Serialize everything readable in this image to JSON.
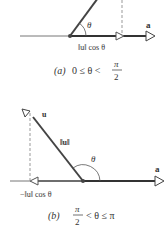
{
  "figure": {
    "panel_a": {
      "vector_u_label": "u",
      "vector_a_label": "a",
      "angle_label": "θ",
      "projection_label": "‖u‖ cos θ",
      "caption_prefix": "(a)",
      "caption_condition": "0 ≤ θ <",
      "caption_frac_num": "π",
      "caption_frac_den": "2"
    },
    "panel_b": {
      "vector_u_label": "u",
      "vector_a_label": "a",
      "angle_label": "θ",
      "norm_label": "‖u‖",
      "projection_label": "−‖u‖ cos θ",
      "caption_prefix": "(b)",
      "caption_frac_num": "π",
      "caption_frac_den": "2",
      "caption_condition": "< θ ≤ π"
    },
    "colors": {
      "vector": "#444444",
      "axis": "#555555",
      "dashed": "#999999"
    }
  }
}
